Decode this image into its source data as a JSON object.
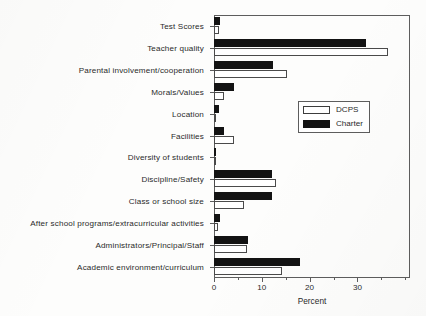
{
  "chart_data": {
    "type": "bar",
    "orientation": "horizontal",
    "title": "",
    "xlabel": "Percent",
    "ylabel": "",
    "xlim": [
      0,
      41
    ],
    "xticks": [
      0,
      10,
      20,
      30
    ],
    "xtick_labels": [
      "0",
      "10",
      "20",
      "30"
    ],
    "xminorticks": [
      5,
      15,
      25,
      35,
      40
    ],
    "grid": false,
    "legend_position": "center-right",
    "categories": [
      "Test Scores",
      "Teacher quality",
      "Parental involvement/cooperation",
      "Morals/Values",
      "Location",
      "Facilities",
      "Diversity of students",
      "Discipline/Safety",
      "Class or school size",
      "After school programs/extracurricular activities",
      "Administrators/Principal/Staff",
      "Academic environment/curriculum"
    ],
    "series": [
      {
        "name": "DCPS",
        "color": "#ffffff",
        "values": [
          1.0,
          36.5,
          15.2,
          2.0,
          0.3,
          4.2,
          0.2,
          13.0,
          6.2,
          0.8,
          7.0,
          14.2
        ]
      },
      {
        "name": "Charter",
        "color": "#131313",
        "values": [
          1.3,
          31.8,
          12.4,
          4.2,
          1.1,
          2.1,
          0.2,
          12.2,
          12.1,
          1.2,
          7.1,
          18.0
        ]
      }
    ]
  },
  "legend": {
    "entries": [
      {
        "label": "DCPS",
        "swatch": "hollow-white-rect"
      },
      {
        "label": "Charter",
        "swatch": "filled-black-rect"
      }
    ]
  },
  "axis": {
    "x_title": "Percent"
  },
  "colors": {
    "charter": "#131313",
    "dcps": "#ffffff",
    "axis": "#5d5d5d",
    "text": "#2a2a2a",
    "paper": "#fdfdfc"
  }
}
